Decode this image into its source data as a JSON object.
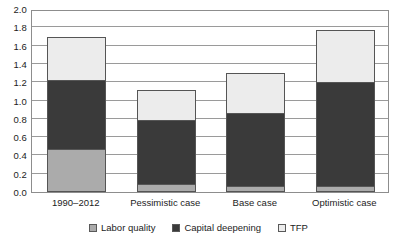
{
  "chart_data": {
    "type": "bar",
    "stacked": true,
    "title": "",
    "subtitle": "",
    "xlabel": "",
    "ylabel": "",
    "ylim": [
      0.0,
      2.0
    ],
    "ytick_step": 0.2,
    "grid": "horizontal",
    "legend_position": "bottom-center",
    "categories": [
      "1990–2012",
      "Pessimistic case",
      "Base case",
      "Optimistic case"
    ],
    "ytick_labels": [
      "2.0",
      "1.8",
      "1.6",
      "1.4",
      "1.2",
      "1.0",
      "0.8",
      "0.6",
      "0.4",
      "0.2",
      "0.0"
    ],
    "ytick_values": [
      2.0,
      1.8,
      1.6,
      1.4,
      1.2,
      1.0,
      0.8,
      0.6,
      0.4,
      0.2,
      0.0
    ],
    "series": [
      {
        "name": "Labor quality",
        "color": "#ababab",
        "values": [
          0.46,
          0.08,
          0.05,
          0.05
        ]
      },
      {
        "name": "Capital deepening",
        "color": "#3a3a3a",
        "values": [
          0.75,
          0.7,
          0.8,
          1.14
        ]
      },
      {
        "name": "TFP",
        "color": "#ececec",
        "values": [
          0.47,
          0.32,
          0.44,
          0.57
        ]
      }
    ],
    "totals": [
      1.68,
      1.1,
      1.29,
      1.76
    ]
  },
  "legend": {
    "items": [
      {
        "label": "Labor quality",
        "color": "#ababab"
      },
      {
        "label": "Capital deepening",
        "color": "#3a3a3a"
      },
      {
        "label": "TFP",
        "color": "#ececec"
      }
    ]
  },
  "colors": {
    "labor_quality": "#ababab",
    "capital_deepening": "#3a3a3a",
    "tfp": "#ececec",
    "axis": "#8d8d8d",
    "gridline": "#9a9a9a",
    "text": "#1c1c1c",
    "background": "#ffffff"
  }
}
